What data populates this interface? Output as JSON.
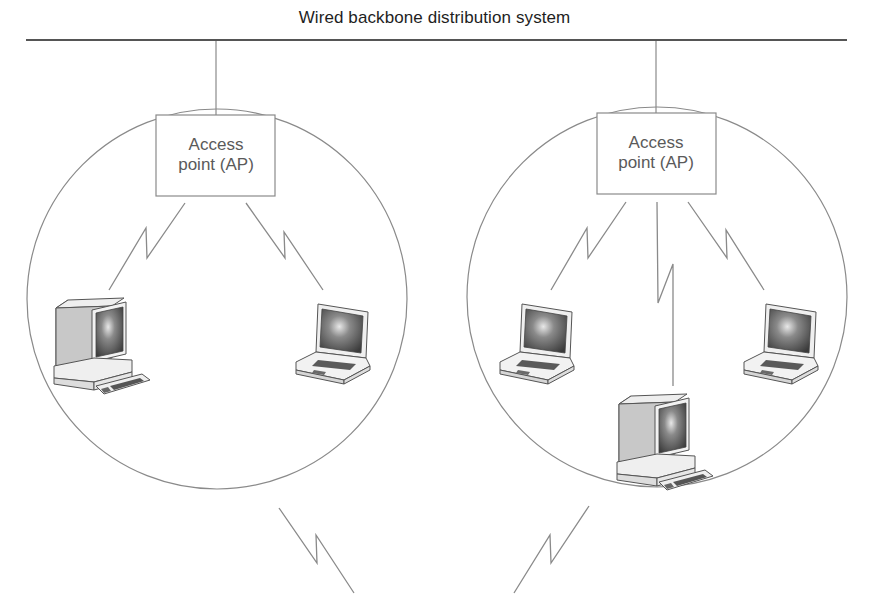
{
  "diagram": {
    "title": "Wired backbone distribution system",
    "colors": {
      "background": "#ffffff",
      "backbone_line": "#555555",
      "stroke": "#8a8a8a",
      "text": "#1e1e1e",
      "ap_text": "#5a5a5a"
    },
    "cells": [
      {
        "id": "cell-left",
        "access_point": {
          "line1": "Access",
          "line2": "point (AP)"
        },
        "devices": [
          {
            "type": "desktop-computer",
            "link": "wireless"
          },
          {
            "type": "laptop",
            "link": "wireless"
          }
        ]
      },
      {
        "id": "cell-right",
        "access_point": {
          "line1": "Access",
          "line2": "point (AP)"
        },
        "devices": [
          {
            "type": "laptop",
            "link": "wireless"
          },
          {
            "type": "desktop-computer",
            "link": "wireless"
          },
          {
            "type": "laptop",
            "link": "wireless"
          }
        ]
      }
    ],
    "inter_cell_links": [
      {
        "from": "cell-left",
        "type": "wireless"
      },
      {
        "from": "cell-right",
        "type": "wireless"
      }
    ]
  }
}
